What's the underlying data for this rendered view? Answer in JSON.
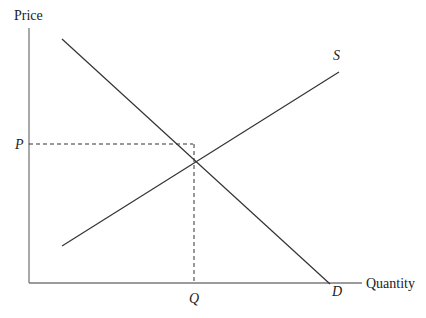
{
  "diagram": {
    "axes": {
      "y_label": "Price",
      "x_label": "Quantity"
    },
    "curves": {
      "supply_label": "S",
      "demand_label": "D"
    },
    "equilibrium": {
      "price_label": "P",
      "quantity_label": "Q"
    },
    "colors": {
      "line": "#333333",
      "axis": "#7a7a7a",
      "text": "#222222"
    }
  }
}
